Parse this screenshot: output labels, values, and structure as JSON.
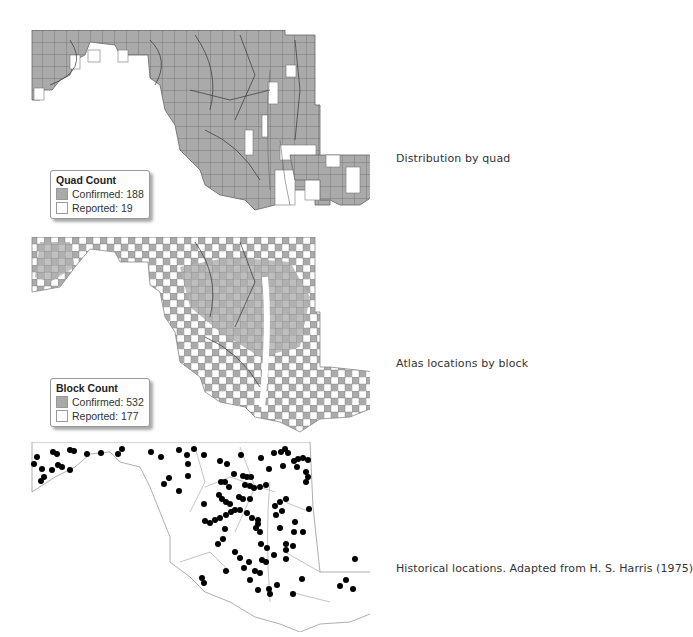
{
  "panels": [
    {
      "id": "quad",
      "caption": "Distribution by quad",
      "legend": {
        "title": "Quad Count",
        "items": [
          {
            "label": "Confirmed: 188",
            "color": "#aaaaaa"
          },
          {
            "label": "Reported: 19",
            "color": "#ffffff"
          }
        ]
      }
    },
    {
      "id": "block",
      "caption": "Atlas locations by block",
      "legend": {
        "title": "Block Count",
        "items": [
          {
            "label": "Confirmed: 532",
            "color": "#aaaaaa"
          },
          {
            "label": "Reported: 177",
            "color": "#ffffff"
          }
        ]
      }
    },
    {
      "id": "historical",
      "caption": "Historical locations. Adapted from H. S. Harris (1975)"
    }
  ],
  "colors": {
    "confirmed_fill": "#aaaaaa",
    "grid_line": "#555555",
    "boundary": "#888888",
    "point": "#000000"
  }
}
